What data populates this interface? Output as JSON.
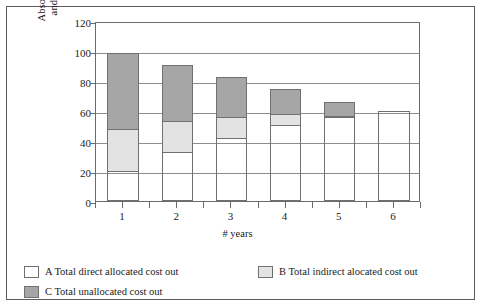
{
  "chart_data": {
    "type": "bar",
    "stacked": true,
    "title": "",
    "xlabel": "# years",
    "ylabel": "Absolute cost development and change in allocation",
    "ylabel_lines": [
      "Absolute cost development",
      "and change in allocation"
    ],
    "categories": [
      "1",
      "2",
      "3",
      "4",
      "5",
      "6"
    ],
    "ylim": [
      0,
      120
    ],
    "yticks": [
      0,
      20,
      40,
      60,
      80,
      100,
      120
    ],
    "grid": true,
    "legend_position": "bottom-left",
    "series": [
      {
        "name": "A Total direct allocated cost out",
        "key": "a",
        "color": "#ffffff",
        "values": [
          20,
          33,
          42,
          51,
          56,
          60
        ]
      },
      {
        "name": "B Total indirect alocated cost out",
        "key": "b",
        "color": "#e3e3e3",
        "values": [
          29,
          21,
          15,
          8,
          1,
          0
        ]
      },
      {
        "name": "C Total unallocated cost out",
        "key": "c",
        "color": "#a6a6a6",
        "values": [
          51,
          38,
          27,
          17,
          10,
          0
        ]
      }
    ],
    "cumulative_tops": [
      {
        "category": "1",
        "a_top": 20,
        "b_top": 49,
        "total": 100
      },
      {
        "category": "2",
        "a_top": 33,
        "b_top": 54,
        "total": 92
      },
      {
        "category": "3",
        "a_top": 42,
        "b_top": 57,
        "total": 84
      },
      {
        "category": "4",
        "a_top": 51,
        "b_top": 59,
        "total": 76
      },
      {
        "category": "5",
        "a_top": 56,
        "b_top": 57,
        "total": 67
      },
      {
        "category": "6",
        "a_top": 60,
        "b_top": 60,
        "total": 60
      }
    ]
  },
  "legend": {
    "items": [
      {
        "label": "A Total direct allocated cost out",
        "swatch": "a"
      },
      {
        "label": "B Total indirect alocated cost out",
        "swatch": "b"
      },
      {
        "label": "C Total unallocated cost out",
        "swatch": "c"
      }
    ]
  },
  "axis": {
    "y_label_line1": "Absolute cost development",
    "y_label_line2": "and change in allocation",
    "x_label": "# years",
    "y_ticks": [
      "0",
      "20",
      "40",
      "60",
      "80",
      "100",
      "120"
    ],
    "x_ticks": [
      "1",
      "2",
      "3",
      "4",
      "5",
      "6"
    ]
  }
}
